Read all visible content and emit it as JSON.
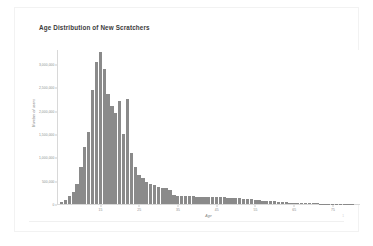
{
  "figure": {
    "title": "Age Distribution of New Scratchers",
    "footer_mark": "1"
  },
  "chart_data": {
    "type": "bar",
    "title": "Age Distribution of New Scratchers",
    "subtitle": "",
    "xlabel": "Age",
    "ylabel": "Number of users",
    "grid": false,
    "legend": null,
    "xlim": [
      4,
      82
    ],
    "ylim": [
      0,
      3300000
    ],
    "xticks": [
      15,
      25,
      35,
      45,
      55,
      65,
      75
    ],
    "xtick_labels": [
      "15",
      "25",
      "35",
      "45",
      "55",
      "65",
      "75"
    ],
    "yticks": [
      0,
      500000,
      1000000,
      1500000,
      2000000,
      2500000,
      3000000
    ],
    "ytick_labels": [
      "0",
      "500,000",
      "1,000,000",
      "1,500,000",
      "2,000,000",
      "2,500,000",
      "3,000,000"
    ],
    "bar_color": "#8a8a8a",
    "categories": [
      "5",
      "6",
      "7",
      "8",
      "9",
      "10",
      "11",
      "12",
      "13",
      "14",
      "15",
      "16",
      "17",
      "18",
      "19",
      "20",
      "21",
      "22",
      "23",
      "24",
      "25",
      "26",
      "27",
      "28",
      "29",
      "30",
      "31",
      "32",
      "33",
      "34",
      "35",
      "36",
      "37",
      "38",
      "39",
      "40",
      "41",
      "42",
      "43",
      "44",
      "45",
      "46",
      "47",
      "48",
      "49",
      "50",
      "51",
      "52",
      "53",
      "54",
      "55",
      "56",
      "57",
      "58",
      "59",
      "60",
      "61",
      "62",
      "63",
      "64",
      "65",
      "66",
      "67",
      "68",
      "69",
      "70",
      "71",
      "72",
      "73",
      "74",
      "75",
      "76",
      "77",
      "78",
      "79",
      "80"
    ],
    "values": [
      40000,
      90000,
      170000,
      260000,
      430000,
      790000,
      1230000,
      1540000,
      2450000,
      3050000,
      3250000,
      2900000,
      2350000,
      2100000,
      1960000,
      2200000,
      1500000,
      2250000,
      1100000,
      800000,
      620000,
      560000,
      480000,
      430000,
      400000,
      370000,
      350000,
      340000,
      300000,
      200000,
      180000,
      175000,
      170000,
      168000,
      165000,
      160000,
      158000,
      155000,
      152000,
      150000,
      148000,
      145000,
      140000,
      135000,
      130000,
      125000,
      120000,
      112000,
      105000,
      98000,
      90000,
      82000,
      75000,
      68000,
      60000,
      54000,
      48000,
      42000,
      37000,
      32000,
      28000,
      24000,
      21000,
      18000,
      16000,
      14000,
      12000,
      10000,
      9000,
      8000,
      7000,
      6000,
      5000,
      4500,
      4000,
      3500
    ]
  }
}
